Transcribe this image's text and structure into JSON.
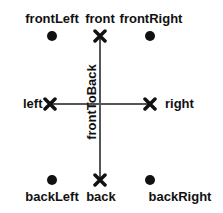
{
  "diagram": {
    "positions": {
      "frontLeft": {
        "label": "frontLeft",
        "marker": "dot"
      },
      "front": {
        "label": "front",
        "marker": "x"
      },
      "frontRight": {
        "label": "frontRight",
        "marker": "dot"
      },
      "left": {
        "label": "left",
        "marker": "x"
      },
      "right": {
        "label": "right",
        "marker": "x"
      },
      "backLeft": {
        "label": "backLeft",
        "marker": "dot"
      },
      "back": {
        "label": "back",
        "marker": "x"
      },
      "backRight": {
        "label": "backRight",
        "marker": "dot"
      }
    },
    "axis_label": "frontToBack",
    "colors": {
      "marker": "#111111",
      "axis": "#555555"
    }
  }
}
